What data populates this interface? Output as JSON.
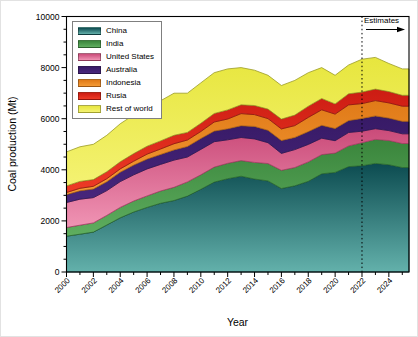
{
  "figure": {
    "background": "#ffffff",
    "frame_color": "#000000",
    "annotation_arrow_direction": "right"
  },
  "chart_data": {
    "type": "area",
    "stacked": true,
    "title": "",
    "xlabel": "Year",
    "ylabel": "Coal production (Mt)",
    "xlim": [
      2000,
      2025.5
    ],
    "ylim": [
      0,
      10000
    ],
    "x_major_ticks": [
      2000,
      2002,
      2004,
      2006,
      2008,
      2010,
      2012,
      2014,
      2016,
      2018,
      2020,
      2022,
      2024
    ],
    "x_minor_ticks": [
      2001,
      2003,
      2005,
      2007,
      2009,
      2011,
      2013,
      2015,
      2017,
      2019,
      2021,
      2023,
      2025
    ],
    "y_major_ticks": [
      0,
      2000,
      4000,
      6000,
      8000,
      10000
    ],
    "y_minor_step": 500,
    "grid": false,
    "legend_position": "top-left",
    "annotation": {
      "label": "Estimates",
      "x": 2022,
      "style": "vertical-dashed-line-with-right-arrow"
    },
    "x": [
      2000,
      2001,
      2002,
      2003,
      2004,
      2005,
      2006,
      2007,
      2008,
      2009,
      2010,
      2011,
      2012,
      2013,
      2014,
      2015,
      2016,
      2017,
      2018,
      2019,
      2020,
      2021,
      2022,
      2023,
      2024,
      2025,
      2025.5
    ],
    "series": [
      {
        "name": "China",
        "color_top": "#0c4b50",
        "color_bottom": "#63b1ab",
        "stroke": "#06393d",
        "values": [
          1400,
          1480,
          1560,
          1840,
          2120,
          2350,
          2530,
          2690,
          2800,
          2970,
          3235,
          3520,
          3650,
          3750,
          3640,
          3565,
          3270,
          3375,
          3550,
          3845,
          3900,
          4125,
          4160,
          4250,
          4200,
          4090,
          4090
        ]
      },
      {
        "name": "India",
        "color_top": "#3a853c",
        "color_bottom": "#5fae5f",
        "stroke": "#2b6b2e",
        "values": [
          340,
          350,
          360,
          375,
          410,
          430,
          450,
          480,
          515,
          555,
          570,
          585,
          605,
          610,
          650,
          680,
          710,
          715,
          760,
          750,
          755,
          810,
          900,
          940,
          945,
          940,
          940
        ]
      },
      {
        "name": "United States",
        "color_top": "#ca4b79",
        "color_bottom": "#f094b4",
        "stroke": "#a83a64",
        "values": [
          980,
          1020,
          990,
          970,
          1010,
          1025,
          1055,
          1040,
          1065,
          975,
          995,
          995,
          920,
          905,
          920,
          815,
          660,
          700,
          685,
          640,
          485,
          525,
          450,
          420,
          390,
          380,
          380
        ]
      },
      {
        "name": "Australia",
        "color_top": "#371a66",
        "color_bottom": "#48267c",
        "stroke": "#2a1550",
        "values": [
          310,
          330,
          340,
          350,
          365,
          380,
          385,
          390,
          400,
          410,
          425,
          415,
          430,
          460,
          490,
          485,
          505,
          480,
          500,
          505,
          475,
          465,
          500,
          500,
          490,
          490,
          490
        ]
      },
      {
        "name": "Indonesia",
        "color_top": "#e07a18",
        "color_bottom": "#f59b36",
        "stroke": "#b06312",
        "values": [
          80,
          95,
          105,
          115,
          130,
          150,
          195,
          215,
          240,
          255,
          275,
          355,
          385,
          475,
          460,
          460,
          455,
          460,
          555,
          610,
          565,
          615,
          580,
          600,
          595,
          590,
          590
        ]
      },
      {
        "name": "Rusia",
        "color_top": "#cc1c13",
        "color_bottom": "#ee3b26",
        "stroke": "#8f120e",
        "values": [
          260,
          270,
          260,
          275,
          280,
          300,
          310,
          315,
          330,
          300,
          320,
          335,
          355,
          345,
          355,
          370,
          385,
          410,
          440,
          440,
          400,
          435,
          450,
          450,
          440,
          425,
          425
        ]
      },
      {
        "name": "Rest of world",
        "color_top": "#e7e63e",
        "color_bottom": "#f4f272",
        "stroke": "#9b9b24",
        "values": [
          1330,
          1355,
          1385,
          1425,
          1485,
          1515,
          1525,
          1570,
          1650,
          1535,
          1580,
          1595,
          1605,
          1455,
          1385,
          1325,
          1315,
          1360,
          1310,
          1210,
          1120,
          1125,
          1290,
          1240,
          1100,
          1035,
          1035
        ]
      }
    ]
  }
}
